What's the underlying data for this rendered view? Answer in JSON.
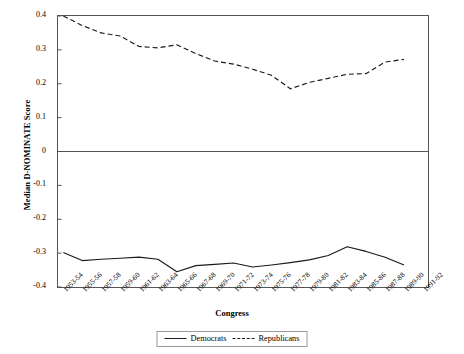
{
  "chart_data": {
    "type": "line",
    "title": "",
    "xlabel": "Congress",
    "ylabel": "Median D-NOMINATE Score",
    "ylim": [
      -0.4,
      0.4
    ],
    "yticks": [
      0.4,
      0.3,
      0.2,
      0.1,
      0,
      -0.1,
      -0.2,
      -0.3,
      -0.4
    ],
    "ytick_labels": [
      "0.4",
      "0.3",
      "0.2",
      "0.1",
      "0",
      "-0.1",
      "-0.2",
      "-0.3",
      "-0.4"
    ],
    "grid": false,
    "zero_line": true,
    "legend_position": "bottom-center",
    "categories": [
      "1953-54",
      "1955-56",
      "1957-58",
      "1959-60",
      "1961-62",
      "1963-64",
      "1965-66",
      "1967-68",
      "1969-70",
      "1971-72",
      "1973-74",
      "1975-76",
      "1977-78",
      "1979-80",
      "1981-82",
      "1983-84",
      "1985-86",
      "1987-88",
      "1989-90",
      "1991-92"
    ],
    "series": [
      {
        "name": "Democrats",
        "style": "solid",
        "color": "#1a1a1a",
        "values": [
          -0.298,
          -0.322,
          -0.318,
          -0.315,
          -0.312,
          -0.318,
          -0.355,
          -0.337,
          -0.333,
          -0.329,
          -0.341,
          -0.335,
          -0.328,
          -0.32,
          -0.307,
          -0.281,
          -0.295,
          -0.312,
          -0.335,
          null
        ]
      },
      {
        "name": "Republicans",
        "style": "dashed",
        "color": "#1a1a1a",
        "values": [
          0.4,
          0.372,
          0.35,
          0.341,
          0.31,
          0.306,
          0.315,
          0.289,
          0.267,
          0.258,
          0.243,
          0.225,
          0.185,
          0.204,
          0.216,
          0.228,
          0.23,
          0.264,
          0.272,
          null
        ]
      }
    ]
  },
  "legend": {
    "items": [
      {
        "label": "Democrats",
        "style": "solid"
      },
      {
        "label": "Republicans",
        "style": "dashed"
      }
    ]
  }
}
